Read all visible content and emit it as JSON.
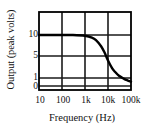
{
  "chart_data": {
    "type": "line",
    "title": "",
    "xlabel": "Frequency (Hz)",
    "ylabel": "Output (peak volts)",
    "x_scale": "log",
    "y_scale": "linear",
    "xtick_labels": [
      "10",
      "100",
      "1k",
      "10k",
      "100k"
    ],
    "xtick_values": [
      10,
      100,
      1000,
      10000,
      100000
    ],
    "ytick_labels": [
      "10",
      "5",
      "1",
      "0"
    ],
    "ytick_values": [
      10,
      5,
      1,
      0
    ],
    "xlim": [
      10,
      100000
    ],
    "ylim": [
      0,
      12.8
    ],
    "grid": true,
    "legend": "none",
    "series": [
      {
        "name": "Output",
        "x": [
          10,
          30,
          100,
          300,
          1000,
          2000,
          3000,
          5000,
          7000,
          10000,
          15000,
          20000,
          30000,
          50000,
          70000,
          100000
        ],
        "y": [
          10.0,
          10.0,
          10.0,
          10.0,
          9.85,
          9.5,
          9.0,
          7.8,
          6.6,
          5.0,
          3.5,
          2.8,
          2.0,
          1.4,
          1.1,
          0.85
        ]
      }
    ]
  },
  "style": {
    "line_color": "#000000",
    "grid_color": "#1a1a1a",
    "frame_color": "#000000",
    "background": "#ffffff",
    "text_color": "#111111"
  }
}
